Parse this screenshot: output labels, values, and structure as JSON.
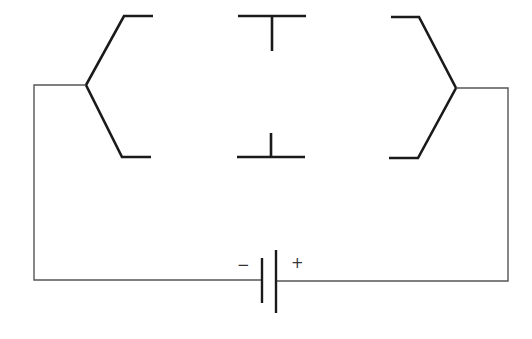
{
  "diagram": {
    "type": "circuit",
    "battery": {
      "negative_label": "−",
      "positive_label": "+"
    },
    "colors": {
      "background": "#ffffff",
      "line": "#1a1a1a",
      "wire": "#555555"
    }
  }
}
